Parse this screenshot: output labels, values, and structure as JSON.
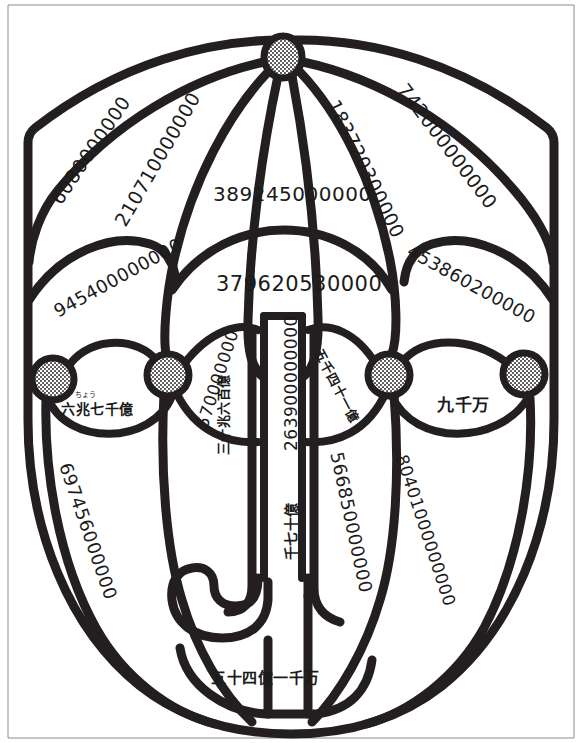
{
  "diagram": {
    "style": {
      "ink_color": "#231f20",
      "background_color": "#ffffff",
      "node_fill_color": "#b8b8b8",
      "frame_color": "#8c8c8c"
    },
    "nodes": [
      {
        "id": "n-top",
        "name": "node-top",
        "cx": 283,
        "cy": 57,
        "rx": 19,
        "ry": 21
      },
      {
        "id": "n-left-outer",
        "name": "node-left-outer",
        "cx": 53,
        "cy": 379,
        "rx": 21,
        "ry": 21
      },
      {
        "id": "n-left-inner",
        "name": "node-left-inner",
        "cx": 168,
        "cy": 375,
        "rx": 21,
        "ry": 21
      },
      {
        "id": "n-right-inner",
        "name": "node-right-inner",
        "cx": 389,
        "cy": 375,
        "rx": 21,
        "ry": 21
      },
      {
        "id": "n-right-outer",
        "name": "node-right-outer",
        "cx": 524,
        "cy": 374,
        "rx": 21,
        "ry": 21
      }
    ],
    "edge_labels": [
      {
        "id": "e1",
        "name": "edge-label-6080000000",
        "text": "6080000000",
        "kind": "number",
        "x": 46,
        "y": 196,
        "rot": -56,
        "size": 19
      },
      {
        "id": "e2",
        "name": "edge-label-210710000000",
        "text": "210710000000",
        "kind": "number",
        "x": 110,
        "y": 219,
        "rot": -60,
        "size": 19
      },
      {
        "id": "e3",
        "name": "edge-label-389245000000",
        "text": "389245000000",
        "kind": "number",
        "x": 213,
        "y": 182,
        "rot": 0,
        "size": 20
      },
      {
        "id": "e4",
        "name": "edge-label-183720300000",
        "text": "183720300000",
        "kind": "number",
        "x": 343,
        "y": 96,
        "rot": 64,
        "size": 19
      },
      {
        "id": "e5",
        "name": "edge-label-742000000000",
        "text": "742000000000",
        "kind": "number",
        "x": 411,
        "y": 79,
        "rot": 53,
        "size": 19
      },
      {
        "id": "e6",
        "name": "edge-label-945400000000",
        "text": "945400000000",
        "kind": "number",
        "x": 50,
        "y": 303,
        "rot": -29,
        "size": 18
      },
      {
        "id": "e7",
        "name": "edge-label-379620530000",
        "text": "379620530000",
        "kind": "number",
        "x": 216,
        "y": 272,
        "rot": 0,
        "size": 21
      },
      {
        "id": "e8",
        "name": "edge-label-453860200000",
        "text": "453860200000",
        "kind": "number",
        "x": 414,
        "y": 240,
        "rot": 29,
        "size": 18
      },
      {
        "id": "e9",
        "name": "edge-label-570000000",
        "text": "570000000",
        "kind": "number",
        "x": 192,
        "y": 424,
        "rot": -72,
        "size": 17
      },
      {
        "id": "e10",
        "name": "edge-label-263900000000",
        "text": "263900000000",
        "kind": "number",
        "x": 281,
        "y": 451,
        "rot": -90,
        "size": 17
      },
      {
        "id": "e11",
        "name": "edge-label-566850000000",
        "text": "566850000000",
        "kind": "number",
        "x": 347,
        "y": 450,
        "rot": 78,
        "size": 18
      },
      {
        "id": "e12",
        "name": "edge-label-80401000000000",
        "text": "80401000000000",
        "kind": "number",
        "x": 411,
        "y": 452,
        "rot": 72,
        "size": 17
      },
      {
        "id": "e13",
        "name": "edge-label-697456000000",
        "text": "697456000000",
        "kind": "number",
        "x": 75,
        "y": 460,
        "rot": 71,
        "size": 18
      }
    ],
    "cjk_labels": [
      {
        "id": "c1",
        "name": "node-label-left-outer",
        "text": "六兆七千億",
        "ruby": "ちょう",
        "x": 61,
        "y": 398,
        "rot": 0,
        "size": 14,
        "vertical": false
      },
      {
        "id": "c2",
        "name": "node-label-right-outer",
        "text": "九千万",
        "ruby": "",
        "x": 437,
        "y": 391,
        "rot": 0,
        "size": 17,
        "vertical": false
      },
      {
        "id": "c3",
        "name": "edge-label-godon-yonjuichi-oku",
        "text": "五千四十一億",
        "ruby": "",
        "x": 327,
        "y": 345,
        "rot": 62,
        "size": 13,
        "vertical": false
      },
      {
        "id": "c4",
        "name": "edge-label-sanjuchou-roppyaku-oku",
        "text": "三十兆六百億",
        "ruby": "",
        "x": 213,
        "y": 455,
        "rot": -90,
        "size": 13,
        "vertical": false
      },
      {
        "id": "c5",
        "name": "edge-label-sen-nanaju-oku",
        "text": "千七十億",
        "ruby": "",
        "x": 280,
        "y": 560,
        "rot": -90,
        "size": 14,
        "vertical": false
      },
      {
        "id": "c6",
        "name": "edge-label-gojuyon-oku-issenman",
        "text": "五十四億一千万",
        "ruby": "",
        "x": 211,
        "y": 666,
        "rot": 0,
        "size": 15,
        "vertical": false
      }
    ]
  }
}
